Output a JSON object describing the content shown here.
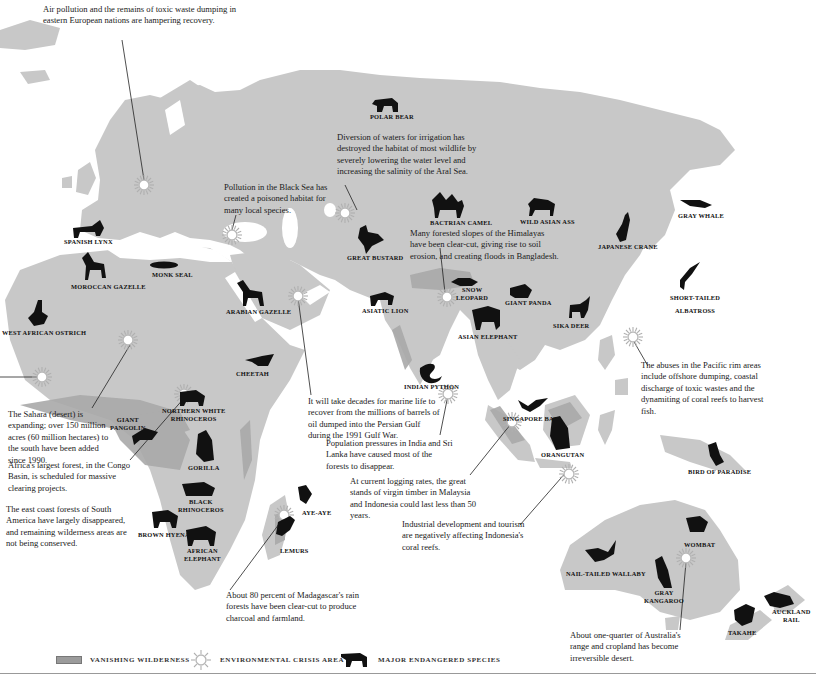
{
  "map": {
    "colors": {
      "land": "#c8c8c8",
      "vanishing_wilderness": "#a9a9a9",
      "water": "#ffffff",
      "silhouette": "#111111",
      "crisis_icon": "#bdbdbd"
    }
  },
  "notes": {
    "eastern_europe": "Air pollution and the remains of toxic waste dumping in eastern European nations are hampering recovery.",
    "aral_sea": "Diversion of waters for irrigation has destroyed the habitat of most wildlife by severely lowering the water level and increasing the salinity of the Aral Sea.",
    "black_sea": "Pollution in the Black Sea has created a poisoned habitat for many local species.",
    "himalayas": "Many forested slopes of the Himalayas have been clear-cut, giving rise to soil erosion, and creating floods in Bangladesh.",
    "sahara": "The Sahara (desert) is expanding; over 150 million acres (60 million hectares) to the south have been added since 1990.",
    "congo": "Africa's largest forest, in the Congo Basin, is scheduled for massive clearing projects.",
    "south_america": "The east coast forests of South America have largely disappeared, and remaining wilderness areas are not being conserved.",
    "persian_gulf": "It will take decades for marine life to recover from the millions of barrels of oil dumped into the Persian Gulf during the 1991 Gulf War.",
    "india_sri_lanka": "Population pressures in India and Sri Lanka have caused most of the forests to disappear.",
    "malaysia_indonesia": "At current logging rates, the great stands of virgin timber in Malaysia and Indonesia could last less than 50 years.",
    "indonesia_reefs": "Industrial development and tourism are negatively affecting Indonesia's coral reefs.",
    "madagascar": "About 80 percent of Madagascar's rain forests have been clear-cut to produce charcoal and farmland.",
    "pacific_rim": "The abuses in the Pacific rim areas include offshore dumping, coastal discharge of toxic wastes and the dynamiting of coral reefs to harvest fish.",
    "australia": "About one-quarter of Australia's range and cropland has become irreversible desert."
  },
  "species": [
    {
      "id": "polar-bear",
      "label": "Polar Bear"
    },
    {
      "id": "spanish-lynx",
      "label": "Spanish Lynx"
    },
    {
      "id": "moroccan-gazelle",
      "label": "Moroccan Gazelle"
    },
    {
      "id": "monk-seal",
      "label": "Monk Seal"
    },
    {
      "id": "west-african-ostrich",
      "label": "West African Ostrich"
    },
    {
      "id": "arabian-gazelle",
      "label": "Arabian Gazelle"
    },
    {
      "id": "great-bustard",
      "label": "Great Bustard"
    },
    {
      "id": "bactrian-camel",
      "label": "Bactrian Camel"
    },
    {
      "id": "wild-asian-ass",
      "label": "Wild Asian Ass"
    },
    {
      "id": "gray-whale",
      "label": "Gray Whale"
    },
    {
      "id": "japanese-crane",
      "label": "Japanese Crane"
    },
    {
      "id": "short-tailed-albatross",
      "label1": "Short-tailed",
      "label2": "Albatross"
    },
    {
      "id": "snow-leopard",
      "label1": "Snow",
      "label2": "Leopard"
    },
    {
      "id": "giant-panda",
      "label": "Giant Panda"
    },
    {
      "id": "asiatic-lion",
      "label": "Asiatic Lion"
    },
    {
      "id": "sika-deer",
      "label": "Sika Deer"
    },
    {
      "id": "asian-elephant",
      "label": "Asian Elephant"
    },
    {
      "id": "cheetah",
      "label": "Cheetah"
    },
    {
      "id": "indian-python",
      "label": "Indian Python"
    },
    {
      "id": "northern-white-rhinoceros",
      "label1": "Northern White",
      "label2": "Rhinoceros"
    },
    {
      "id": "giant-pangolin",
      "label1": "Giant",
      "label2": "Pangolin"
    },
    {
      "id": "gorilla",
      "label": "Gorilla"
    },
    {
      "id": "black-rhinoceros",
      "label1": "Black",
      "label2": "Rhinoceros"
    },
    {
      "id": "brown-hyena",
      "label": "Brown Hyena"
    },
    {
      "id": "african-elephant",
      "label1": "African",
      "label2": "Elephant"
    },
    {
      "id": "aye-aye",
      "label": "Aye-Aye"
    },
    {
      "id": "lemurs",
      "label": "Lemurs"
    },
    {
      "id": "singapore-bat",
      "label": "Singapore Bat"
    },
    {
      "id": "orangutan",
      "label": "Orangutan"
    },
    {
      "id": "bird-of-paradise",
      "label": "Bird of Paradise"
    },
    {
      "id": "wombat",
      "label": "Wombat"
    },
    {
      "id": "nail-tailed-wallaby",
      "label": "Nail-tailed Wallaby"
    },
    {
      "id": "gray-kangaroo",
      "label1": "Gray",
      "label2": "Kangaroo"
    },
    {
      "id": "auckland-rail",
      "label1": "Auckland",
      "label2": "Rail"
    },
    {
      "id": "takahe",
      "label": "Takahe"
    }
  ],
  "legend": {
    "vanishing_wilderness": "Vanishing Wilderness",
    "crisis_area": "Environmental Crisis Area",
    "endangered_species": "Major Endangered Species"
  }
}
